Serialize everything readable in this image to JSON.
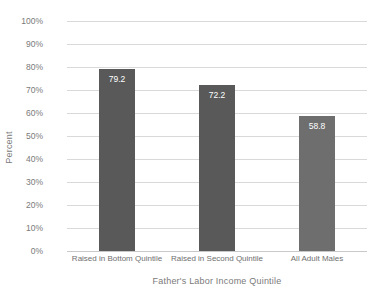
{
  "chart_data": {
    "type": "bar",
    "title": "",
    "subtitle": "",
    "xlabel": "Father's Labor Income Quintile",
    "ylabel": "Percent",
    "categories": [
      "Raised in Bottom Quintile",
      "Raised in Second Quintile",
      "All Adult Males"
    ],
    "values": [
      79.2,
      72.2,
      58.8
    ],
    "value_labels": [
      "79.2",
      "72.2",
      "58.8"
    ],
    "bar_colors": [
      "#595959",
      "#595959",
      "#6e6e6e"
    ],
    "ylim": [
      0,
      100
    ],
    "ytick_values": [
      0,
      10,
      20,
      30,
      40,
      50,
      60,
      70,
      80,
      90,
      100
    ],
    "ytick_labels": [
      "0%",
      "10%",
      "20%",
      "30%",
      "40%",
      "50%",
      "60%",
      "70%",
      "80%",
      "90%",
      "100%"
    ],
    "grid": "horizontal",
    "legend": "none",
    "gridline_color": "#d9d9d9",
    "axis_text_color": "#7a7a7a",
    "value_label_color": "#ffffff",
    "background_color": "#ffffff"
  }
}
